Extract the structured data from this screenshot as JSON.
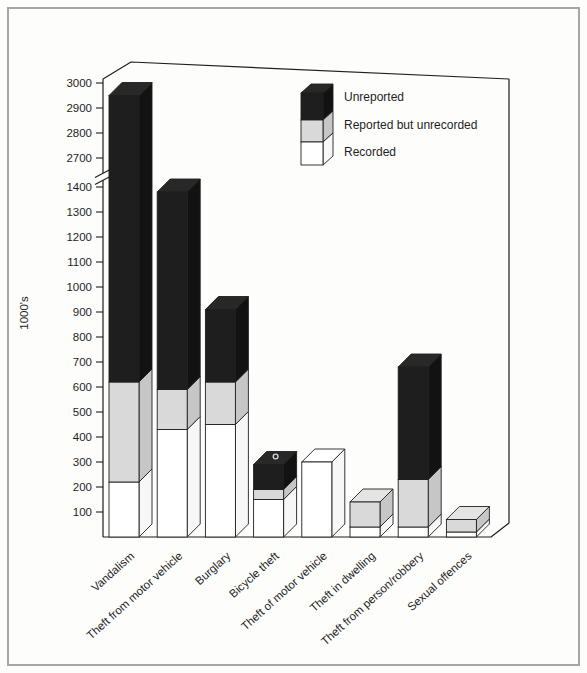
{
  "figure": {
    "background": "#fdfdfc",
    "border_color": "#a6a6a6",
    "line_color": "#1f1f1f"
  },
  "chart_data": {
    "type": "bar",
    "variant": "3d-stacked-with-axis-break",
    "title": "",
    "xlabel": "",
    "ylabel": "1000's",
    "categories": [
      "Vandalism",
      "Theft from motor vehicle",
      "Burglary",
      "Bicycle theft",
      "Theft of motor vehicle",
      "Theft in dwelling",
      "Theft from person/robbery",
      "Sexual offences"
    ],
    "stack_order_bottom_to_top": [
      "Recorded",
      "Reported but unrecorded",
      "Unreported"
    ],
    "series": [
      {
        "name": "Recorded",
        "color": "#ffffff",
        "side_color": "#f7f7f7",
        "top_color": "#ffffff",
        "values": [
          220,
          430,
          450,
          150,
          300,
          40,
          40,
          20
        ]
      },
      {
        "name": "Reported but unrecorded",
        "color": "#d9d9d9",
        "side_color": "#c6c6c6",
        "top_color": "#e4e4e4",
        "values": [
          400,
          160,
          170,
          40,
          0,
          100,
          190,
          50
        ]
      },
      {
        "name": "Unreported",
        "color": "#1e1e1e",
        "side_color": "#121212",
        "top_color": "#282828",
        "values": [
          2330,
          790,
          290,
          100,
          0,
          0,
          450,
          0
        ]
      }
    ],
    "stack_totals": [
      2950,
      1380,
      910,
      290,
      300,
      140,
      680,
      70
    ],
    "legend": {
      "position": "top-right",
      "entries": [
        "Unreported",
        "Reported but unrecorded",
        "Recorded"
      ]
    },
    "y_axis": {
      "unit_label": "1000's",
      "ticks_below_break": [
        100,
        200,
        300,
        400,
        500,
        600,
        700,
        800,
        900,
        1000,
        1100,
        1200,
        1300,
        1400
      ],
      "ticks_above_break": [
        2700,
        2800,
        2900,
        3000
      ],
      "break_between": [
        1400,
        2700
      ],
      "grid": false
    },
    "annotations": [
      {
        "target_category": "Bicycle theft",
        "shape": "small-circle-on-top-face"
      }
    ]
  }
}
